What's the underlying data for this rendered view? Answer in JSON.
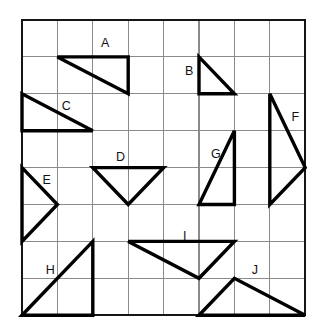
{
  "page": {
    "background_color": "#ffffff",
    "width": 327,
    "height": 336
  },
  "grid": {
    "origin_x": 22,
    "origin_y": 20,
    "cell_width": 35.4,
    "cell_height": 36.9,
    "columns": 8,
    "rows": 8,
    "line_color": "#8a8a8a",
    "border_color": "#151515",
    "border_width": 2.4,
    "line_width": 1.1
  },
  "chart_data": {
    "type": "scatter",
    "xlabel": "",
    "ylabel": "",
    "grid": true,
    "legend": "none",
    "xlim": [
      0,
      8
    ],
    "ylim": [
      0,
      8
    ],
    "note": "Ten labelled triangles drawn on an 8x8 square grid. Vertices given in grid units with origin at the top-left corner of the grid, x increasing right and y increasing down.",
    "series": [
      {
        "name": "A",
        "vertices": [
          [
            1,
            1
          ],
          [
            3,
            1
          ],
          [
            3,
            2
          ]
        ],
        "label_cell": [
          2.35,
          0.65
        ]
      },
      {
        "name": "B",
        "vertices": [
          [
            5,
            1
          ],
          [
            5,
            2
          ],
          [
            6,
            2
          ]
        ],
        "label_cell": [
          4.72,
          1.4
        ]
      },
      {
        "name": "C",
        "vertices": [
          [
            0,
            2
          ],
          [
            0,
            3
          ],
          [
            2,
            3
          ]
        ],
        "label_cell": [
          1.25,
          2.36
        ]
      },
      {
        "name": "D",
        "vertices": [
          [
            2,
            4
          ],
          [
            4,
            4
          ],
          [
            3,
            5
          ]
        ],
        "label_cell": [
          2.78,
          3.72
        ]
      },
      {
        "name": "E",
        "vertices": [
          [
            0,
            4
          ],
          [
            1,
            5
          ],
          [
            0,
            6
          ]
        ],
        "label_cell": [
          0.7,
          4.36
        ]
      },
      {
        "name": "F",
        "vertices": [
          [
            7,
            2
          ],
          [
            8,
            4
          ],
          [
            7,
            5
          ]
        ],
        "label_cell": [
          7.72,
          2.66
        ]
      },
      {
        "name": "G",
        "vertices": [
          [
            6,
            3
          ],
          [
            6,
            5
          ],
          [
            5,
            5
          ]
        ],
        "label_cell": [
          5.48,
          3.66
        ]
      },
      {
        "name": "H",
        "vertices": [
          [
            0,
            8
          ],
          [
            2,
            6
          ],
          [
            2,
            8
          ]
        ],
        "label_cell": [
          0.8,
          6.8
        ]
      },
      {
        "name": "I",
        "vertices": [
          [
            3,
            6
          ],
          [
            6,
            6
          ],
          [
            5,
            7
          ]
        ],
        "label_cell": [
          4.6,
          5.88
        ]
      },
      {
        "name": "J",
        "vertices": [
          [
            5,
            8
          ],
          [
            6,
            7
          ],
          [
            8,
            8
          ]
        ],
        "label_cell": [
          6.58,
          6.8
        ]
      }
    ]
  },
  "labels": {
    "a": "A",
    "b": "B",
    "c": "C",
    "d": "D",
    "e": "E",
    "f": "F",
    "g": "G",
    "h": "H",
    "i": "I",
    "j": "J"
  }
}
